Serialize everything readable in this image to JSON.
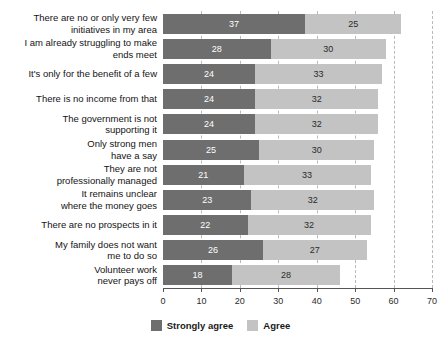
{
  "chart_data": {
    "type": "bar",
    "orientation": "horizontal",
    "stacked": true,
    "title": "",
    "xlabel": "",
    "ylabel": "",
    "xlim": [
      0,
      70
    ],
    "xticks": [
      0,
      10,
      20,
      30,
      40,
      50,
      60,
      70
    ],
    "grid": true,
    "grid_axis": "x",
    "legend_position": "bottom",
    "categories": [
      "There are no or only very few\ninitiatives in my area",
      "I am already struggling to make\nends meet",
      "It's only for the benefit of a few",
      "There is no income from that",
      "The government is not\nsupporting it",
      "Only strong men\nhave a say",
      "They are not\nprofessionally managed",
      "It remains unclear\nwhere the money goes",
      "There are no prospects in it",
      "My family does not want\nme to do so",
      "Volunteer work\nnever pays off"
    ],
    "series": [
      {
        "name": "Strongly agree",
        "color": "#6e6e6e",
        "values": [
          37,
          28,
          24,
          24,
          24,
          25,
          21,
          23,
          22,
          26,
          18
        ]
      },
      {
        "name": "Agree",
        "color": "#c3c3c3",
        "values": [
          25,
          30,
          33,
          32,
          32,
          30,
          33,
          32,
          32,
          27,
          28
        ]
      }
    ],
    "totals": [
      62,
      58,
      57,
      56,
      56,
      55,
      54,
      55,
      54,
      53,
      46
    ]
  },
  "legend": {
    "items": [
      {
        "label": "Strongly agree",
        "color": "#6e6e6e"
      },
      {
        "label": "Agree",
        "color": "#c3c3c3"
      }
    ]
  },
  "axis": {
    "tick_labels": [
      "0",
      "10",
      "20",
      "30",
      "40",
      "50",
      "60",
      "70"
    ]
  }
}
